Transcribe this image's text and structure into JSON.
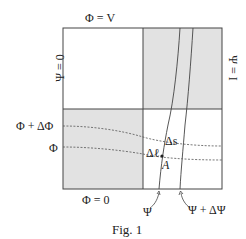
{
  "figure": {
    "caption": "Fig. 1",
    "boundary_labels": {
      "top": "Φ = V",
      "bottom": "Φ = 0",
      "left": "Ψ = 0",
      "right": "Ψ = I"
    },
    "equipotential_labels": {
      "upper": "Φ + ΔΦ",
      "lower": "Φ"
    },
    "streamline_labels": {
      "left": "Ψ",
      "right": "Ψ + ΔΨ"
    },
    "cell_labels": {
      "delta_s": "Δs",
      "delta_l": "Δℓ",
      "point": "A"
    },
    "colors": {
      "shaded": "#e2e2e2",
      "line": "#444444",
      "background": "#ffffff"
    }
  }
}
